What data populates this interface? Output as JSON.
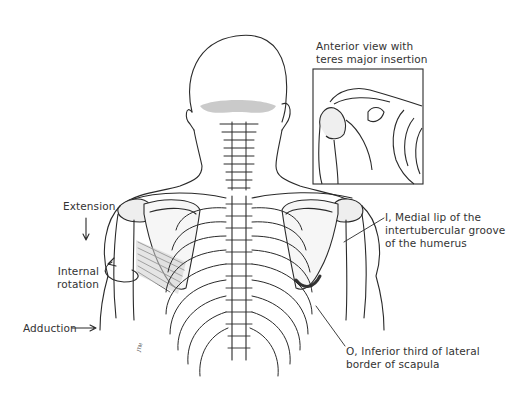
{
  "figure": {
    "inset": {
      "title_line1": "Anterior view with",
      "title_line2": "teres major insertion"
    },
    "actions": {
      "extension": "Extension",
      "internal_rotation_line1": "Internal",
      "internal_rotation_line2": "rotation",
      "adduction": "Adduction"
    },
    "insertion": {
      "line1": "I, Medial lip of the",
      "line2": "intertubercular groove",
      "line3": "of the humerus"
    },
    "origin": {
      "line1": "O, Inferior third of lateral",
      "line2": "border of scapula"
    },
    "colors": {
      "background": "#ffffff",
      "outline": "#2a2a2a",
      "bone_shade": "#c8c8c8",
      "muscle_shade": "#9a9a9a"
    }
  }
}
